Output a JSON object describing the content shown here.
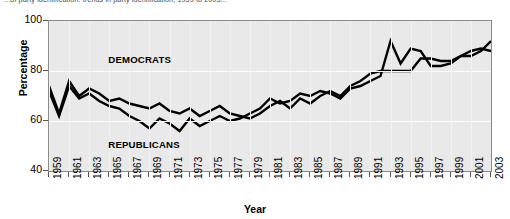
{
  "caption": {
    "text": "...of party identification: trends in party identification, 1959 to 2003..."
  },
  "chart_data": {
    "type": "line",
    "title": "",
    "xlabel": "Year",
    "ylabel": "Percentage",
    "xlim": [
      1959,
      2003
    ],
    "ylim": [
      40,
      100
    ],
    "yticks": [
      40,
      60,
      80,
      100
    ],
    "xticks": [
      1959,
      1961,
      1963,
      1965,
      1967,
      1969,
      1971,
      1973,
      1975,
      1977,
      1979,
      1981,
      1983,
      1985,
      1987,
      1989,
      1991,
      1993,
      1995,
      1997,
      1999,
      2001,
      2003
    ],
    "grid": true,
    "legend_position": "inline-annotation",
    "x": [
      1959,
      1960,
      1961,
      1962,
      1963,
      1964,
      1965,
      1966,
      1967,
      1968,
      1969,
      1970,
      1971,
      1972,
      1973,
      1974,
      1975,
      1976,
      1977,
      1978,
      1979,
      1980,
      1981,
      1982,
      1983,
      1984,
      1985,
      1986,
      1987,
      1988,
      1989,
      1990,
      1991,
      1992,
      1993,
      1994,
      1995,
      1996,
      1997,
      1998,
      1999,
      2000,
      2001,
      2002,
      2003
    ],
    "series": [
      {
        "name": "DEMOCRATS",
        "label_color": "#000000",
        "values": [
          74,
          63,
          76,
          70,
          73,
          71,
          68,
          69,
          67,
          66,
          65,
          67,
          64,
          63,
          65,
          62,
          64,
          66,
          63,
          62,
          61,
          63,
          66,
          68,
          65,
          69,
          67,
          70,
          72,
          70,
          74,
          76,
          79,
          80,
          80,
          80,
          80,
          85,
          85,
          84,
          84,
          86,
          86,
          88,
          92
        ]
      },
      {
        "name": "REPUBLICANS",
        "label_color": "#000000",
        "values": [
          72,
          62,
          74,
          69,
          71,
          68,
          66,
          65,
          62,
          60,
          57,
          61,
          59,
          56,
          61,
          58,
          60,
          62,
          60,
          61,
          63,
          65,
          69,
          67,
          68,
          71,
          70,
          72,
          71,
          69,
          73,
          74,
          76,
          78,
          92,
          83,
          89,
          88,
          82,
          82,
          83,
          86,
          88,
          89,
          88
        ]
      }
    ],
    "annotations": [
      {
        "text": "DEMOCRATS",
        "x": 1965,
        "y": 84
      },
      {
        "text": "REPUBLICANS",
        "x": 1965,
        "y": 50
      }
    ]
  }
}
